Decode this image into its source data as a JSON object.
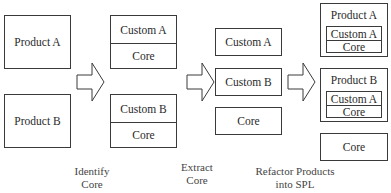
{
  "stage1": {
    "product_a": "Product A",
    "product_b": "Product B"
  },
  "stage2": {
    "box_a": {
      "custom": "Custom A",
      "core": "Core"
    },
    "box_b": {
      "custom": "Custom B",
      "core": "Core"
    }
  },
  "stage3": {
    "custom_a": "Custom A",
    "custom_b": "Custom B",
    "core": "Core"
  },
  "stage4": {
    "product_a": {
      "title": "Product A",
      "custom": "Custom A",
      "core": "Core"
    },
    "product_b": {
      "title": "Product B",
      "custom": "Custom A",
      "core": "Core"
    },
    "core": "Core"
  },
  "captions": {
    "step1_line1": "Identify",
    "step1_line2": "Core",
    "step2_line1": "Extract",
    "step2_line2": "Core",
    "step3_line1": "Refactor Products",
    "step3_line2": "into SPL"
  }
}
